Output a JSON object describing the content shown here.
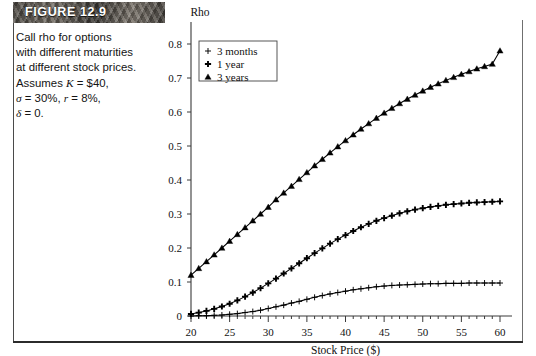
{
  "banner": {
    "label": "FIGURE 12.9"
  },
  "caption": {
    "line1": "Call rho for options",
    "line2": "with different maturities",
    "line3": "at different stock prices.",
    "line4_prefix": "Assumes ",
    "line4_k": "K",
    "line4_val": " = $40,",
    "line5_sigma": "σ",
    "line5_mid": " = 30%, ",
    "line5_r": "r",
    "line5_end": " = 8%,",
    "line6_delta": "δ",
    "line6_end": " = 0."
  },
  "chart_data": {
    "type": "line",
    "title": "",
    "ylabel": "Rho",
    "xlabel": "Stock Price ($)",
    "xlim": [
      20,
      60
    ],
    "ylim": [
      0,
      0.85
    ],
    "xticks": [
      20,
      25,
      30,
      35,
      40,
      45,
      50,
      55,
      60
    ],
    "yticks": [
      0,
      0.1,
      0.2,
      0.3,
      0.4,
      0.5,
      0.6,
      0.7,
      0.8
    ],
    "ytick_labels": [
      "0",
      "0.1",
      "0.2",
      "0.3",
      "0.4",
      "0.5",
      "0.6",
      "0.7",
      "0.8"
    ],
    "xtick_labels": [
      "20",
      "25",
      "30",
      "35",
      "40",
      "45",
      "50",
      "55",
      "60"
    ],
    "grid": false,
    "legend_position": "top-left",
    "x": [
      20,
      21,
      22,
      23,
      24,
      25,
      26,
      27,
      28,
      29,
      30,
      31,
      32,
      33,
      34,
      35,
      36,
      37,
      38,
      39,
      40,
      41,
      42,
      43,
      44,
      45,
      46,
      47,
      48,
      49,
      50,
      51,
      52,
      53,
      54,
      55,
      56,
      57,
      58,
      59,
      60
    ],
    "series": [
      {
        "name": "3 months",
        "marker": "plus-thin",
        "values": [
          0.0,
          0.001,
          0.001,
          0.002,
          0.003,
          0.005,
          0.007,
          0.01,
          0.013,
          0.017,
          0.022,
          0.027,
          0.032,
          0.038,
          0.043,
          0.049,
          0.055,
          0.06,
          0.065,
          0.069,
          0.073,
          0.077,
          0.08,
          0.083,
          0.086,
          0.088,
          0.09,
          0.091,
          0.092,
          0.093,
          0.094,
          0.095,
          0.095,
          0.096,
          0.096,
          0.096,
          0.097,
          0.097,
          0.097,
          0.097,
          0.097
        ]
      },
      {
        "name": "1 year",
        "marker": "plus-bold",
        "values": [
          0.006,
          0.01,
          0.015,
          0.021,
          0.028,
          0.036,
          0.046,
          0.057,
          0.069,
          0.082,
          0.096,
          0.11,
          0.125,
          0.14,
          0.155,
          0.17,
          0.185,
          0.199,
          0.213,
          0.226,
          0.238,
          0.25,
          0.261,
          0.271,
          0.28,
          0.288,
          0.295,
          0.302,
          0.308,
          0.313,
          0.317,
          0.321,
          0.324,
          0.327,
          0.329,
          0.331,
          0.333,
          0.334,
          0.335,
          0.336,
          0.337
        ]
      },
      {
        "name": "3 years",
        "marker": "triangle",
        "values": [
          0.12,
          0.14,
          0.16,
          0.18,
          0.2,
          0.22,
          0.24,
          0.26,
          0.28,
          0.3,
          0.32,
          0.342,
          0.362,
          0.382,
          0.402,
          0.422,
          0.442,
          0.461,
          0.48,
          0.498,
          0.516,
          0.533,
          0.55,
          0.566,
          0.582,
          0.597,
          0.611,
          0.625,
          0.638,
          0.65,
          0.662,
          0.673,
          0.683,
          0.693,
          0.702,
          0.711,
          0.719,
          0.727,
          0.734,
          0.741,
          0.78
        ]
      }
    ]
  }
}
